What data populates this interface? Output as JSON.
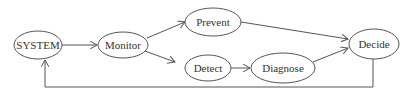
{
  "diagram": {
    "type": "flow",
    "nodes": [
      {
        "id": "system",
        "label": "SYSTEM",
        "cx": 38,
        "cy": 45,
        "rx": 24,
        "ry": 14
      },
      {
        "id": "monitor",
        "label": "Monitor",
        "cx": 123,
        "cy": 45,
        "rx": 25,
        "ry": 13
      },
      {
        "id": "prevent",
        "label": "Prevent",
        "cx": 213,
        "cy": 22,
        "rx": 28,
        "ry": 14
      },
      {
        "id": "detect",
        "label": "Detect",
        "cx": 208,
        "cy": 68,
        "rx": 23,
        "ry": 13
      },
      {
        "id": "diagnose",
        "label": "Diagnose",
        "cx": 283,
        "cy": 68,
        "rx": 32,
        "ry": 15
      },
      {
        "id": "decide",
        "label": "Decide",
        "cx": 374,
        "cy": 44,
        "rx": 25,
        "ry": 15
      }
    ],
    "edges": [
      {
        "from": "system",
        "to": "monitor"
      },
      {
        "from": "monitor",
        "to": "prevent"
      },
      {
        "from": "monitor",
        "to": "detect"
      },
      {
        "from": "prevent",
        "to": "decide"
      },
      {
        "from": "detect",
        "to": "diagnose"
      },
      {
        "from": "diagnose",
        "to": "decide"
      },
      {
        "from": "decide",
        "to": "system",
        "style": "feedback-loop"
      }
    ]
  },
  "labels": {
    "system": "SYSTEM",
    "monitor": "Monitor",
    "prevent": "Prevent",
    "detect": "Detect",
    "diagnose": "Diagnose",
    "decide": "Decide"
  }
}
